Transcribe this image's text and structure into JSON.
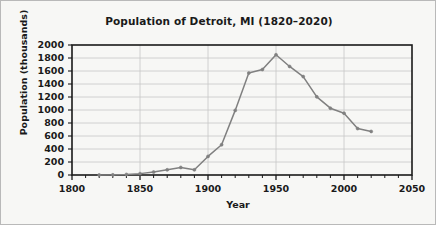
{
  "chart_data": {
    "type": "line",
    "title": "Population of Detroit, MI (1820–2020)",
    "xlabel": "Year",
    "ylabel": "Population (thousands)",
    "xlim": [
      1800,
      2050
    ],
    "ylim": [
      0,
      2000
    ],
    "xticks": [
      1800,
      1850,
      1900,
      1950,
      2000,
      2050
    ],
    "xtick_labels": [
      "1800",
      "1850",
      "1900",
      "1950",
      "2000",
      "2050"
    ],
    "x_minor_tick_step": 10,
    "yticks": [
      0,
      200,
      400,
      600,
      800,
      1000,
      1200,
      1400,
      1600,
      1800,
      2000
    ],
    "ytick_labels": [
      "0",
      "200",
      "400",
      "600",
      "800",
      "1000",
      "1200",
      "1400",
      "1600",
      "1800",
      "2000"
    ],
    "grid": "horizontal-and-vertical-major",
    "legend": "none",
    "series": [
      {
        "name": "Detroit population",
        "color": "#808080",
        "marker": "plus-dot",
        "x": [
          1820,
          1830,
          1840,
          1850,
          1860,
          1870,
          1880,
          1890,
          1900,
          1910,
          1920,
          1930,
          1940,
          1950,
          1960,
          1970,
          1980,
          1990,
          2000,
          2010,
          2020
        ],
        "values": [
          1,
          2,
          9,
          21,
          46,
          80,
          116,
          80,
          286,
          466,
          994,
          1569,
          1623,
          1850,
          1670,
          1514,
          1203,
          1028,
          951,
          714,
          670
        ]
      }
    ]
  },
  "figure": {
    "background_color": "#f7f7f5",
    "border_color": "#b9b9b9",
    "axes_color": "#1a1a1a",
    "grid_color": "#c6c6c6",
    "text_color": "#1a1a1a"
  }
}
